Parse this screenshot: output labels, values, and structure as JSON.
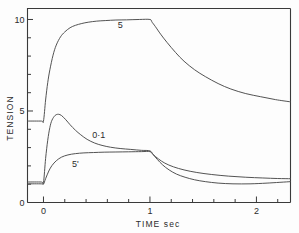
{
  "chart_data": {
    "type": "line",
    "title": "",
    "subtitle": "",
    "xlabel": "TIME   sec",
    "ylabel": "TENSION",
    "xlim": [
      -0.15,
      2.32
    ],
    "ylim": [
      0,
      10.6
    ],
    "grid": false,
    "legend_position": "inline-curve-labels",
    "x_ticks_major": [
      0,
      1,
      2
    ],
    "x_tick_labels": [
      "0",
      "1",
      "2"
    ],
    "x_ticks_minor_step": 0.2,
    "y_ticks_major": [
      0,
      5,
      10
    ],
    "y_tick_labels": [
      "0",
      "5",
      "10"
    ],
    "y_ticks_minor_step": 1,
    "annotations": [
      {
        "text": "5",
        "x": 0.72,
        "y": 9.55
      },
      {
        "text": "0·1",
        "x": 0.52,
        "y": 3.55
      },
      {
        "text": "5'",
        "x": 0.3,
        "y": 1.95
      }
    ],
    "series": [
      {
        "name": "5",
        "label": "5",
        "baseline": 4.45,
        "plateau": 10.0,
        "final": 5.5,
        "x": [
          -0.15,
          -0.02,
          0.0,
          0.02,
          0.04,
          0.06,
          0.09,
          0.12,
          0.16,
          0.2,
          0.25,
          0.3,
          0.36,
          0.42,
          0.5,
          0.58,
          0.68,
          0.78,
          0.9,
          1.0,
          1.02,
          1.05,
          1.1,
          1.16,
          1.24,
          1.32,
          1.42,
          1.52,
          1.64,
          1.76,
          1.9,
          2.04,
          2.18,
          2.32
        ],
        "y": [
          4.45,
          4.45,
          4.45,
          5.6,
          6.55,
          7.25,
          8.05,
          8.6,
          9.05,
          9.32,
          9.55,
          9.68,
          9.78,
          9.85,
          9.91,
          9.94,
          9.97,
          9.98,
          10.0,
          10.0,
          9.85,
          9.62,
          9.2,
          8.75,
          8.2,
          7.72,
          7.25,
          6.88,
          6.5,
          6.2,
          5.95,
          5.78,
          5.62,
          5.5
        ]
      },
      {
        "name": "0.1",
        "label": "0·1",
        "baseline": 1.12,
        "peak": 4.82,
        "peak_x": 0.14,
        "plateau": 2.82,
        "final": 1.22,
        "x": [
          -0.15,
          -0.02,
          0.0,
          0.02,
          0.04,
          0.06,
          0.08,
          0.11,
          0.14,
          0.17,
          0.21,
          0.25,
          0.3,
          0.35,
          0.41,
          0.48,
          0.55,
          0.63,
          0.72,
          0.82,
          0.92,
          1.0,
          1.03,
          1.07,
          1.12,
          1.18,
          1.25,
          1.33,
          1.42,
          1.52,
          1.64,
          1.78,
          1.94,
          2.1,
          2.32
        ],
        "y": [
          1.12,
          1.12,
          1.1,
          2.4,
          3.4,
          4.1,
          4.5,
          4.76,
          4.82,
          4.75,
          4.52,
          4.25,
          3.95,
          3.7,
          3.45,
          3.25,
          3.12,
          3.02,
          2.95,
          2.9,
          2.85,
          2.82,
          2.62,
          2.35,
          2.05,
          1.78,
          1.55,
          1.38,
          1.24,
          1.14,
          1.06,
          1.02,
          1.02,
          1.06,
          1.14
        ]
      },
      {
        "name": "5prime",
        "label": "5'",
        "baseline": 1.02,
        "plateau": 2.78,
        "final": 1.3,
        "x": [
          -0.15,
          -0.02,
          0.0,
          0.02,
          0.05,
          0.08,
          0.12,
          0.17,
          0.23,
          0.3,
          0.38,
          0.47,
          0.57,
          0.68,
          0.8,
          0.92,
          1.0,
          1.03,
          1.08,
          1.14,
          1.22,
          1.32,
          1.44,
          1.58,
          1.74,
          1.9,
          2.06,
          2.2,
          2.32
        ],
        "y": [
          1.02,
          1.02,
          1.0,
          1.3,
          1.72,
          2.02,
          2.28,
          2.48,
          2.6,
          2.67,
          2.71,
          2.73,
          2.75,
          2.76,
          2.77,
          2.78,
          2.78,
          2.62,
          2.38,
          2.15,
          1.95,
          1.78,
          1.64,
          1.53,
          1.44,
          1.38,
          1.34,
          1.31,
          1.3
        ]
      }
    ]
  },
  "axes": {
    "y_title": "TENSION",
    "x_title_main": "TIME",
    "x_title_unit": "sec"
  }
}
